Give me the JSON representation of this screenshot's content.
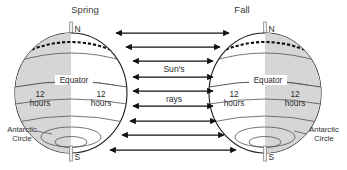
{
  "diagram": {
    "kind": "earth-sun-equinox-illumination-diagram",
    "background_color": "#ffffff",
    "shade_color": "#d6d6d6",
    "line_color": "#1c1c1c",
    "text_color": "#2b2b2b"
  },
  "titles": {
    "left": "Spring",
    "right": "Fall"
  },
  "sun": {
    "label_line_1": "Sun's",
    "label_line_2": "rays",
    "arrow_rows": 9,
    "arrow_style": "double-headed",
    "direction": "horizontal"
  },
  "globes": [
    {
      "id": "left-globe",
      "season": "Spring",
      "shaded_side": "left",
      "north_pole_label": "N",
      "south_pole_label": "S",
      "equator_label": "Equator",
      "antarctic_label_line_1": "Antarctic",
      "antarctic_label_line_2": "Circle",
      "hours_left": {
        "number": "12",
        "unit": "hours"
      },
      "hours_right": {
        "number": "12",
        "unit": "hours"
      }
    },
    {
      "id": "right-globe",
      "season": "Fall",
      "shaded_side": "right",
      "north_pole_label": "N",
      "south_pole_label": "S",
      "equator_label": "Equator",
      "antarctic_label_line_1": "Antarctic",
      "antarctic_label_line_2": "Circle",
      "hours_left": {
        "number": "12",
        "unit": "hours"
      },
      "hours_right": {
        "number": "12",
        "unit": "hours"
      }
    }
  ]
}
